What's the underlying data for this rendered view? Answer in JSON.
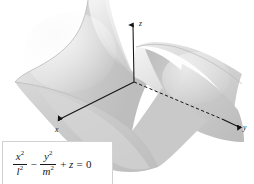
{
  "figure": {
    "kind": "3d-surface-plot",
    "surface_name": "hyperbolic-paraboloid",
    "caption_equation_plain": "x^2/l^2 - y^2/m^2 + z = 0",
    "background_color": "#ffffff",
    "surface_light_color": "#ededed",
    "surface_mid_color": "#cfcfcf",
    "surface_dark_color": "#b4b4b4",
    "axis_color": "#141414"
  },
  "axes": {
    "origin": {
      "x": 134,
      "y": 82
    },
    "z": {
      "label": "z",
      "arrow_tip": {
        "x": 133,
        "y": 20
      },
      "label_pos": {
        "x": 139,
        "y": 24
      }
    },
    "x": {
      "label": "x",
      "arrow_tip": {
        "x": 57,
        "y": 121
      },
      "label_pos": {
        "x": 57,
        "y": 131
      }
    },
    "y": {
      "label": "y",
      "arrow_tip": {
        "x": 241,
        "y": 130
      },
      "label_pos": {
        "x": 243,
        "y": 127
      }
    }
  },
  "equation": {
    "term1": {
      "numerator": "x",
      "numerator_exp": "2",
      "denominator": "l",
      "denominator_exp": "2"
    },
    "operator1": "−",
    "term2": {
      "numerator": "y",
      "numerator_exp": "2",
      "denominator": "m",
      "denominator_exp": "2"
    },
    "operator2": "+",
    "term3": "z",
    "equals": "=",
    "result": "0"
  }
}
